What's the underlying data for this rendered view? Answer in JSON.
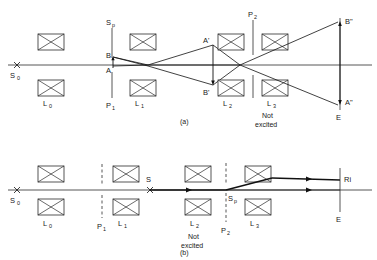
{
  "figure": {
    "title": "",
    "panels": [
      {
        "id": "a",
        "caption": "(a)",
        "note": {
          "line1": "Not",
          "line2": "excited"
        },
        "source_label": "S",
        "source_sub": "0",
        "lenses": [
          {
            "label": "L",
            "sub": "0"
          },
          {
            "label": "L",
            "sub": "1"
          },
          {
            "label": "L",
            "sub": "2"
          },
          {
            "label": "L",
            "sub": "3"
          }
        ],
        "planes": [
          {
            "label": "S",
            "sub": "p",
            "position": "above"
          },
          {
            "label": "P",
            "sub": "1",
            "position": "below"
          },
          {
            "label": "P",
            "sub": "2",
            "position": "above"
          }
        ],
        "object_points": [
          {
            "label": "B",
            "prime": ""
          },
          {
            "label": "A",
            "prime": ""
          }
        ],
        "image_points": [
          {
            "label": "A",
            "prime": "'"
          },
          {
            "label": "B",
            "prime": "'"
          },
          {
            "label": "B",
            "prime": "\""
          },
          {
            "label": "A",
            "prime": "\""
          }
        ],
        "screen_label": "E"
      },
      {
        "id": "b",
        "caption": "(b)",
        "note": {
          "line1": "Not",
          "line2": "excited"
        },
        "source_label": "S",
        "source_sub": "0",
        "midpoint_label": "S",
        "lenses": [
          {
            "label": "L",
            "sub": "0"
          },
          {
            "label": "L",
            "sub": "1"
          },
          {
            "label": "L",
            "sub": "2"
          },
          {
            "label": "L",
            "sub": "3"
          }
        ],
        "planes": [
          {
            "label": "P",
            "sub": "1",
            "position": "below"
          },
          {
            "label": "S",
            "sub": "p",
            "position": "below"
          },
          {
            "label": "P",
            "sub": "2",
            "position": "below"
          }
        ],
        "screen_label": "E",
        "ray_label": "Ri"
      }
    ]
  },
  "labels": {
    "S0_a": "S",
    "S0_a_sub": "0",
    "L0_a": "L",
    "L0_a_sub": "0",
    "Sp_a": "S",
    "Sp_a_sub": "p",
    "P1_a": "P",
    "P1_a_sub": "1",
    "L1_a": "L",
    "L1_a_sub": "1",
    "B_a": "B",
    "A_a": "A",
    "Aprime_a": "A'",
    "Bprime_a": "B'",
    "L2_a": "L",
    "L2_a_sub": "2",
    "P2_a": "P",
    "P2_a_sub": "2",
    "L3_a": "L",
    "L3_a_sub": "3",
    "not_a": "Not",
    "excited_a": "excited",
    "Bdprime_a": "B\"",
    "Adprime_a": "A\"",
    "E_a": "E",
    "cap_a": "(a)",
    "S0_b": "S",
    "S0_b_sub": "0",
    "L0_b": "L",
    "L0_b_sub": "0",
    "P1_b": "P",
    "P1_b_sub": "1",
    "L1_b": "L",
    "L1_b_sub": "1",
    "S_b": "S",
    "L2_b": "L",
    "L2_b_sub": "2",
    "not_b": "Not",
    "excited_b": "excited",
    "Sp_b": "S",
    "Sp_b_sub": "p",
    "P2_b": "P",
    "P2_b_sub": "2",
    "L3_b": "L",
    "L3_b_sub": "3",
    "Ri_b": "Ri",
    "E_b": "E",
    "cap_b": "(b)"
  },
  "colors": {
    "ink": "#1a1a1a",
    "line": "#2b2b2b",
    "ray": "#111111",
    "background": "#ffffff"
  }
}
